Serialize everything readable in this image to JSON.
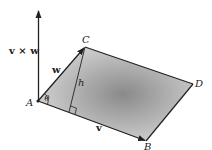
{
  "diagram": {
    "points": {
      "A": "A",
      "B": "B",
      "C": "C",
      "D": "D"
    },
    "vectors": {
      "v": "v",
      "w": "w",
      "cross": "v × w"
    },
    "height_label": "h",
    "angle_label": "θ",
    "colors": {
      "stroke": "#222222",
      "fill_light": "#d4d4d4",
      "fill_dark": "#8a8a8a"
    }
  }
}
